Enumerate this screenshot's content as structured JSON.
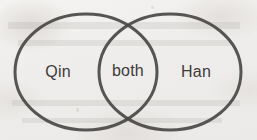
{
  "figure": {
    "name": "venn-diagram",
    "background_color": "#f1efed",
    "stroke_color": "#4a4846",
    "text_color": "#3d3b39",
    "width": 257,
    "height": 140
  },
  "diagram_data": {
    "type": "venn",
    "sets": 2,
    "labels": {
      "left": "Qin",
      "overlap": "both",
      "right": "Han"
    },
    "circles": [
      {
        "name": "left-circle",
        "label": "Qin",
        "cx": 86,
        "cy": 72,
        "rx": 71,
        "ry": 58
      },
      {
        "name": "right-circle",
        "label": "Han",
        "cx": 170,
        "cy": 72,
        "rx": 71,
        "ry": 58
      }
    ],
    "label_positions": [
      {
        "key": "left",
        "text": "Qin",
        "x": 58,
        "y": 72
      },
      {
        "key": "overlap",
        "text": "both",
        "x": 128,
        "y": 71
      },
      {
        "key": "right",
        "text": "Han",
        "x": 196,
        "y": 72
      }
    ],
    "intersection_points": [
      {
        "x": 128,
        "y": 23
      },
      {
        "x": 128,
        "y": 119
      }
    ],
    "stroke_width": 3
  },
  "ghost_marks": [
    {
      "name": "ghost-line-top",
      "x": 8,
      "y": 22,
      "w": 232,
      "h": 7
    },
    {
      "name": "ghost-line-upper-mid",
      "x": 18,
      "y": 40,
      "w": 214,
      "h": 6
    },
    {
      "name": "ghost-line-lower-mid",
      "x": 12,
      "y": 100,
      "w": 228,
      "h": 6
    },
    {
      "name": "ghost-line-bottom",
      "x": 22,
      "y": 118,
      "w": 200,
      "h": 5
    },
    {
      "name": "ghost-speck-left",
      "x": 76,
      "y": 108,
      "w": 3,
      "h": 4
    },
    {
      "name": "ghost-speck-top",
      "x": 151,
      "y": 6,
      "w": 3,
      "h": 3
    }
  ]
}
